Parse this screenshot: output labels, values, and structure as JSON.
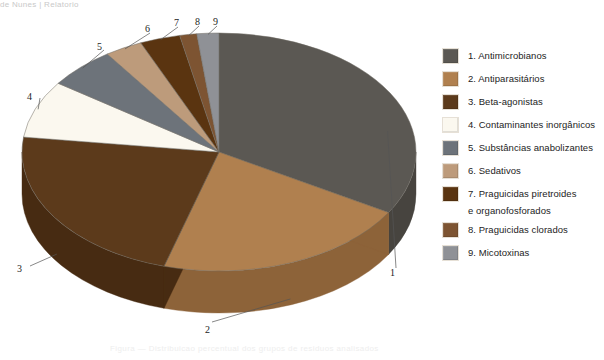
{
  "page": {
    "ghost_top": "de Nunes    |    Relatorio",
    "ghost_bottom": "Figura — Distribuicao percentual dos grupos de residuos analisados"
  },
  "chart_data": {
    "type": "pie",
    "title": "",
    "three_d": true,
    "start_angle_deg": 0,
    "direction": "clockwise",
    "legend_position": "right",
    "categories": [
      "Antimicrobianos",
      "Antiparasitários",
      "Beta-agonistas",
      "Contaminantes inorgânicos",
      "Substâncias anabolizantes",
      "Praguicidas piretroides e organofosforados",
      "Sedativos",
      "Praguicidas clorados",
      "Micotoxinas"
    ],
    "slices": [
      {
        "index": 1,
        "label": "Antimicrobianos",
        "value": 33.5,
        "color": "#5b5853",
        "side_color": "#47443f"
      },
      {
        "index": 2,
        "label": "Antiparasitários",
        "value": 21.0,
        "color": "#b0804f",
        "side_color": "#8d6339"
      },
      {
        "index": 3,
        "label": "Beta-agonistas",
        "value": 22.5,
        "color": "#5c3a1b",
        "side_color": "#472b12"
      },
      {
        "index": 4,
        "label": "Contaminantes inorgânicos",
        "value": 7.8,
        "color": "#fbf8ef",
        "side_color": "#d8d2c4"
      },
      {
        "index": 5,
        "label": "Substâncias anabolizantes",
        "value": 5.6,
        "color": "#6d737a",
        "side_color": "#565b61"
      },
      {
        "index": 6,
        "label": "Sedativos",
        "value": 3.1,
        "color": "#bd9b7b",
        "side_color": "#9b7c5e"
      },
      {
        "index": 7,
        "label": "Praguicidas piretroides e organofosforados",
        "value": 3.3,
        "color": "#5a3410",
        "side_color": "#43260b"
      },
      {
        "index": 8,
        "label": "Praguicidas clorados",
        "value": 1.4,
        "color": "#7d5432",
        "side_color": "#5f3e23"
      },
      {
        "index": 9,
        "label": "Micotoxinas",
        "value": 1.8,
        "color": "#8f9196",
        "side_color": "#717379"
      }
    ],
    "callout_labels": [
      {
        "id": "1",
        "text": "1"
      },
      {
        "id": "2",
        "text": "2"
      },
      {
        "id": "3",
        "text": "3"
      },
      {
        "id": "4",
        "text": "4"
      },
      {
        "id": "5",
        "text": "5"
      },
      {
        "id": "6",
        "text": "6"
      },
      {
        "id": "7",
        "text": "7"
      },
      {
        "id": "8",
        "text": "8"
      },
      {
        "id": "9",
        "text": "9"
      }
    ]
  },
  "legend": {
    "items": [
      {
        "num": "1",
        "label": "1. Antimicrobianos",
        "cont": "",
        "color": "#5b5853"
      },
      {
        "num": "2",
        "label": "2. Antiparasitários",
        "cont": "",
        "color": "#b0804f"
      },
      {
        "num": "3",
        "label": "3. Beta-agonistas",
        "cont": "",
        "color": "#5c3a1b"
      },
      {
        "num": "4",
        "label": "4. Contaminantes inorgânicos",
        "cont": "",
        "color": "#fbf8ef"
      },
      {
        "num": "5",
        "label": "5. Substâncias anabolizantes",
        "cont": "",
        "color": "#6d737a"
      },
      {
        "num": "6",
        "label": "6. Sedativos",
        "cont": "",
        "color": "#bd9b7b"
      },
      {
        "num": "7",
        "label": "7. Praguicidas piretroides",
        "cont": "e organofosforados",
        "color": "#5a3410"
      },
      {
        "num": "8",
        "label": "8. Praguicidas clorados",
        "cont": "",
        "color": "#7d5432"
      },
      {
        "num": "9",
        "label": "9. Micotoxinas",
        "cont": "",
        "color": "#8f9196"
      }
    ]
  }
}
